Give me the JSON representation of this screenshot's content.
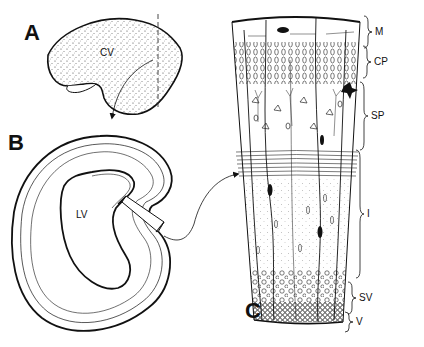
{
  "figure": {
    "panels": [
      {
        "id": "A",
        "label": "A",
        "description": "Lateral view of cerebral vesicle",
        "region_label": "CV"
      },
      {
        "id": "B",
        "label": "B",
        "description": "Coronal section through hemisphere",
        "region_label": "LV"
      },
      {
        "id": "C",
        "label": "C",
        "description": "Enlarged sector of cortical wall showing layers"
      }
    ],
    "layers": [
      {
        "abbr": "M",
        "name": "marginal zone"
      },
      {
        "abbr": "CP",
        "name": "cortical plate"
      },
      {
        "abbr": "SP",
        "name": "subplate"
      },
      {
        "abbr": "I",
        "name": "intermediate zone"
      },
      {
        "abbr": "SV",
        "name": "subventricular zone"
      },
      {
        "abbr": "V",
        "name": "ventricular zone"
      }
    ],
    "colors": {
      "ink": "#111111",
      "background": "#ffffff",
      "stipple": "#555555"
    }
  }
}
